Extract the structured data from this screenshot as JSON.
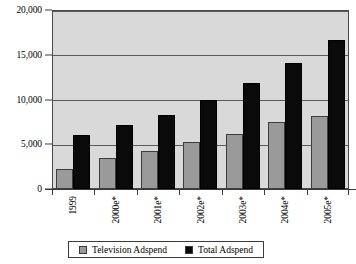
{
  "chart_data": {
    "type": "bar",
    "title": "",
    "xlabel": "",
    "ylabel": "",
    "categories": [
      "1999",
      "2000e*",
      "2001e*",
      "2002e*",
      "2003e*",
      "2004e*",
      "2005e*"
    ],
    "series": [
      {
        "name": "Television Adspend",
        "color": "#9a9a9a",
        "values": [
          2200,
          3500,
          4300,
          5200,
          6200,
          7500,
          8200
        ]
      },
      {
        "name": "Total Adspend",
        "color": "#0a0a0a",
        "values": [
          6000,
          7100,
          8300,
          10000,
          11900,
          14100,
          16600
        ]
      }
    ],
    "ylim": [
      0,
      20000
    ],
    "ytick_values": [
      0,
      5000,
      10000,
      15000,
      20000
    ],
    "ytick_labels": [
      "0",
      "5,000",
      "10,000",
      "15,000",
      "20,000"
    ],
    "grid": true,
    "legend_position": "bottom",
    "plot_background": "#d9d9d9"
  },
  "legend": {
    "items": [
      {
        "label": "Television Adspend",
        "swatch": "tv"
      },
      {
        "label": "Total Adspend",
        "swatch": "total"
      }
    ]
  }
}
